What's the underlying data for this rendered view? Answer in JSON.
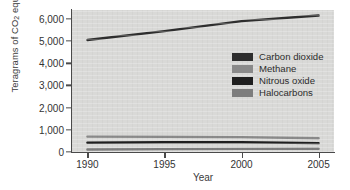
{
  "chart_data": {
    "type": "line",
    "title": "",
    "xlabel": "Year",
    "ylabel": "Teragrams of CO2 equivalents",
    "ylabel_prefix": "Teragrams of CO",
    "ylabel_sub": "2",
    "ylabel_suffix": " equivalents",
    "x": [
      1990,
      1995,
      2000,
      2005
    ],
    "xlim": [
      1989,
      2006
    ],
    "ylim": [
      0,
      6400
    ],
    "xticks": [
      "1990",
      "1995",
      "2000",
      "2005"
    ],
    "yticks": [
      "0",
      "1,000",
      "2,000",
      "3,000",
      "4,000",
      "5,000",
      "6,000"
    ],
    "ytick_values": [
      0,
      1000,
      2000,
      3000,
      4000,
      5000,
      6000
    ],
    "grid": false,
    "legend_position": "center-right",
    "series": [
      {
        "name": "Carbon dioxide",
        "color": "#2e2e2e",
        "values": [
          5050,
          5450,
          5900,
          6150
        ]
      },
      {
        "name": "Methane",
        "color": "#8a8a8a",
        "values": [
          700,
          690,
          670,
          620
        ]
      },
      {
        "name": "Nitrous oxide",
        "color": "#1f1f1f",
        "values": [
          420,
          440,
          440,
          400
        ]
      },
      {
        "name": "Halocarbons",
        "color": "#7d7d7d",
        "values": [
          110,
          130,
          140,
          145
        ]
      }
    ]
  },
  "legend": {
    "items": [
      {
        "label": "Carbon dioxide",
        "color": "#2e2e2e"
      },
      {
        "label": "Methane",
        "color": "#8a8a8a"
      },
      {
        "label": "Nitrous oxide",
        "color": "#1f1f1f"
      },
      {
        "label": "Halocarbons",
        "color": "#7d7d7d"
      }
    ]
  },
  "style": {
    "plot_background": "#d9d9d7",
    "axis_color": "#4a4a4a",
    "text_color": "#333333",
    "page_background": "#ffffff"
  }
}
